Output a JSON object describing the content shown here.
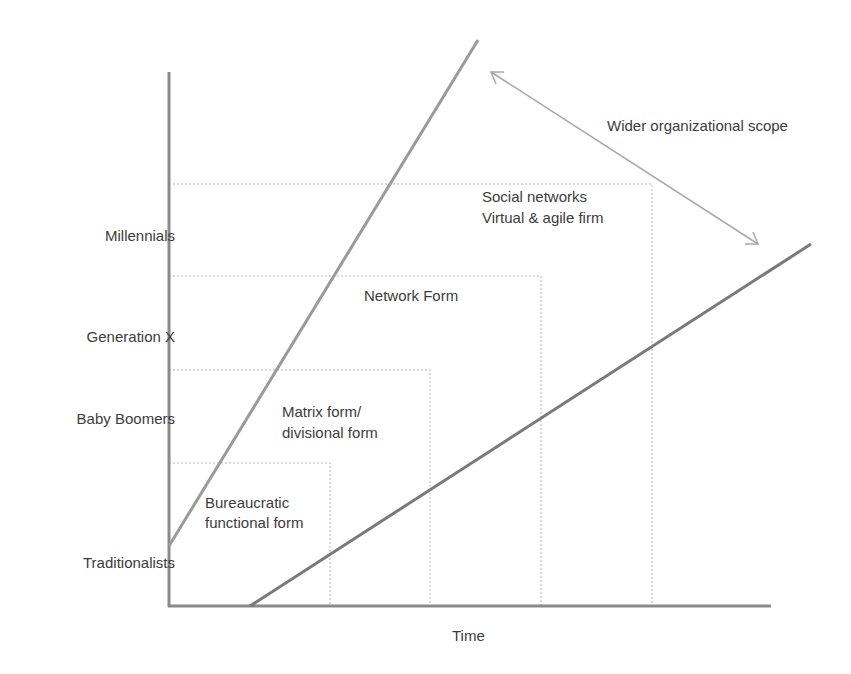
{
  "diagram": {
    "type": "evolution-of-organizational-forms",
    "x_axis_label": "Time",
    "y_axis_labels": [
      "Traditionalists",
      "Baby Boomers",
      "Generation X",
      "Millennials"
    ],
    "forms": [
      {
        "label_line1": "Bureaucratic",
        "label_line2": "functional form"
      },
      {
        "label_line1": "Matrix form/",
        "label_line2": "divisional form"
      },
      {
        "label_line1": "Network Form",
        "label_line2": ""
      },
      {
        "label_line1": "Social  networks",
        "label_line2": "Virtual & agile firm"
      }
    ],
    "scope_annotation": "Wider organizational scope",
    "colors": {
      "axis": "#8a8a8a",
      "upper_line": "#9a9a9a",
      "lower_line": "#7a7a7a",
      "dotted_box": "#b5b5b5",
      "arrow": "#a8a8a8",
      "text": "#3c3c3c"
    }
  }
}
